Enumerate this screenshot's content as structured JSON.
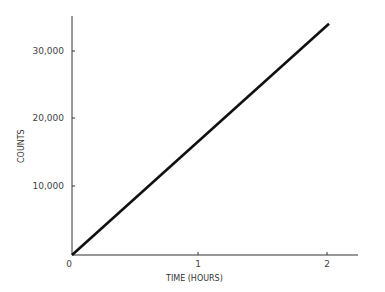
{
  "chart_data": {
    "type": "line",
    "title": "",
    "xlabel": "TIME (HOURS)",
    "ylabel": "COUNTS",
    "x": [
      0,
      2
    ],
    "series": [
      {
        "name": "counts",
        "values": [
          0,
          34000
        ]
      }
    ],
    "xticks": [
      "0",
      "1",
      "2"
    ],
    "yticks": [
      "10,000",
      "20,000",
      "30,000"
    ],
    "xlim": [
      0,
      2.25
    ],
    "ylim": [
      0,
      35000
    ],
    "grid": false,
    "legend": "none",
    "line_color": "#111111"
  }
}
